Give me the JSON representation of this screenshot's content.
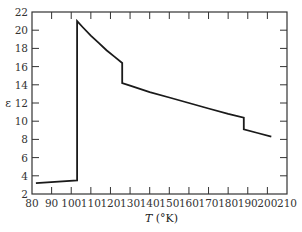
{
  "chart_data": {
    "type": "line",
    "title": "",
    "xlabel_italic": "T",
    "xlabel_rest": " (°K)",
    "xlabel": "T (°K)",
    "ylabel": "ε",
    "xlim": [
      80,
      210
    ],
    "ylim": [
      2,
      22
    ],
    "xticks": [
      80,
      90,
      100,
      110,
      120,
      130,
      140,
      150,
      160,
      170,
      180,
      190,
      200,
      210
    ],
    "yticks": [
      2,
      4,
      6,
      8,
      10,
      12,
      14,
      16,
      18,
      20,
      22
    ],
    "grid": false,
    "legend": null,
    "line_color": "#1a1a1a",
    "series": [
      {
        "name": "dielectric constant",
        "points": [
          [
            82,
            3.2
          ],
          [
            103,
            3.5
          ],
          [
            103,
            21.0
          ],
          [
            106,
            20.3
          ],
          [
            110,
            19.4
          ],
          [
            114,
            18.6
          ],
          [
            118,
            17.8
          ],
          [
            122,
            17.1
          ],
          [
            126,
            16.4
          ],
          [
            126,
            14.2
          ],
          [
            130,
            13.9
          ],
          [
            140,
            13.2
          ],
          [
            150,
            12.6
          ],
          [
            160,
            12.0
          ],
          [
            170,
            11.4
          ],
          [
            180,
            10.8
          ],
          [
            188,
            10.4
          ],
          [
            188,
            9.1
          ],
          [
            195,
            8.7
          ],
          [
            202,
            8.3
          ]
        ]
      }
    ]
  },
  "layout": {
    "plot_left": 32,
    "plot_right": 287,
    "plot_top": 12,
    "plot_bottom": 194
  }
}
